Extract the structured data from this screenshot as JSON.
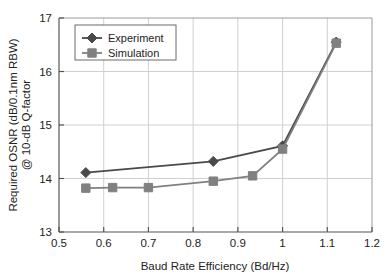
{
  "chart_data": {
    "type": "line",
    "title": "",
    "xlabel": "Baud Rate Efficiency (Bd/Hz)",
    "ylabel_line1": "Required OSNR (dB/0.1nm RBW)",
    "ylabel_line2": "@ 10-dB Q-factor",
    "xlim": [
      0.5,
      1.2
    ],
    "ylim": [
      13,
      17
    ],
    "xticks": [
      0.5,
      0.6,
      0.7,
      0.8,
      0.9,
      1,
      1.1,
      1.2
    ],
    "xtick_labels": [
      "0.5",
      "0.6",
      "0.7",
      "0.8",
      "0.9",
      "1",
      "1.1",
      "1.2"
    ],
    "yticks": [
      13,
      14,
      15,
      16,
      17
    ],
    "ytick_labels": [
      "13",
      "14",
      "15",
      "16",
      "17"
    ],
    "grid": true,
    "legend_position": "upper left",
    "series": [
      {
        "name": "Experiment",
        "marker": "diamond",
        "color": "#4a4a4a",
        "x": [
          0.56,
          0.845,
          1.0,
          1.12
        ],
        "values": [
          14.11,
          14.32,
          14.61,
          16.55
        ]
      },
      {
        "name": "Simulation",
        "marker": "square",
        "color": "#808080",
        "x": [
          0.56,
          0.62,
          0.7,
          0.845,
          0.933,
          1.0,
          1.12
        ],
        "values": [
          13.82,
          13.83,
          13.83,
          13.95,
          14.05,
          14.55,
          16.53
        ]
      }
    ]
  },
  "legend": {
    "items": [
      {
        "label": "Experiment"
      },
      {
        "label": "Simulation"
      }
    ]
  },
  "colors": {
    "experiment": "#4a4a4a",
    "simulation": "#808080",
    "grid": "#d0d0d0",
    "axis": "#555555",
    "background": "#ffffff"
  }
}
